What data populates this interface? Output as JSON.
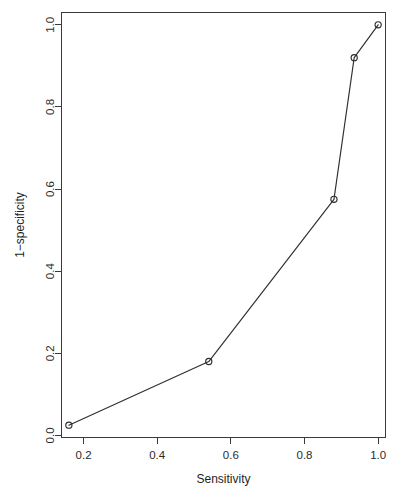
{
  "chart_data": {
    "type": "line",
    "title": "",
    "subtitle": "",
    "xlabel": "Sensitivity",
    "ylabel": "1−specificity",
    "xlim": [
      0.14,
      1.02
    ],
    "ylim": [
      -0.005,
      1.03
    ],
    "xticks": [
      0.2,
      0.4,
      0.6,
      0.8,
      1.0
    ],
    "xtick_labels": [
      "0.2",
      "0.4",
      "0.6",
      "0.8",
      "1.0"
    ],
    "yticks": [
      0.0,
      0.2,
      0.4,
      0.6,
      0.8,
      1.0
    ],
    "ytick_labels": [
      "0.0",
      "0.2",
      "0.4",
      "0.6",
      "0.8",
      "1.0"
    ],
    "grid": false,
    "legend": null,
    "legend_position": "none",
    "marker": "open-circle",
    "line_color": "#2e2e2e",
    "marker_color": "#2e2e2e",
    "axis_color": "#3a3a3a",
    "background_color": "#ffffff",
    "box_frame": true,
    "x": [
      0.16,
      0.54,
      0.88,
      0.935,
      1.0
    ],
    "y": [
      0.025,
      0.18,
      0.575,
      0.92,
      1.0
    ],
    "series": [
      {
        "name": "ROC",
        "x": [
          0.16,
          0.54,
          0.88,
          0.935,
          1.0
        ],
        "values": [
          0.025,
          0.18,
          0.575,
          0.92,
          1.0
        ]
      }
    ],
    "points": [
      {
        "x": 0.16,
        "y": 0.025
      },
      {
        "x": 0.54,
        "y": 0.18
      },
      {
        "x": 0.88,
        "y": 0.575
      },
      {
        "x": 0.935,
        "y": 0.92
      },
      {
        "x": 1.0,
        "y": 1.0
      }
    ]
  }
}
